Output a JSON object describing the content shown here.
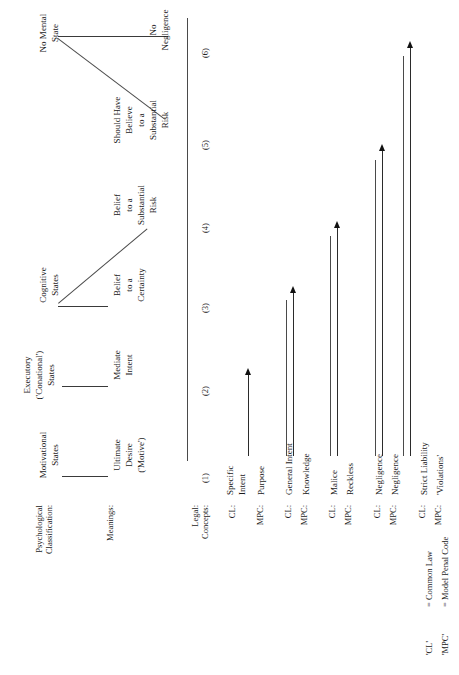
{
  "figure": {
    "type": "taxonomy-diagram",
    "orientation": "rotated-90-ccw",
    "row_labels": {
      "psychological": "Psychological\nClassification:",
      "psychological_line1": "Psychological",
      "psychological_line2": "Classification:",
      "meanings": "Meanings:",
      "legal_line1": "Legal:",
      "legal_line2": "Concepts:"
    },
    "groups": [
      {
        "id": "motivational",
        "heading_line1": "Motivational",
        "heading_line2": "States",
        "meaning_line1": "Ultimate",
        "meaning_line2": "Desire",
        "meaning_line3": "('Motive')",
        "column": "(1)"
      },
      {
        "id": "executory",
        "heading_line1": "Executory",
        "heading_line2": "('Conational')",
        "heading_line3": "States",
        "meaning_line1": "Mediate",
        "meaning_line2": "Intent",
        "column": "(2)"
      },
      {
        "id": "cognitive",
        "heading_line1": "Cognitive",
        "heading_line2": "States",
        "children": [
          {
            "meaning_line1": "Belief",
            "meaning_line2": "to a",
            "meaning_line3": "Certainty",
            "column": "(3)"
          },
          {
            "meaning_line1": "Belief",
            "meaning_line2": "to a",
            "meaning_line3": "Substantial",
            "meaning_line4": "Risk",
            "column": "(4)"
          }
        ]
      },
      {
        "id": "no-mental-state",
        "heading_line1": "No Mental",
        "heading_line2": "State",
        "children": [
          {
            "meaning_line1": "Should Have",
            "meaning_line2": "Believe",
            "meaning_line3": "to a",
            "meaning_line4": "Substantial",
            "meaning_line5": "Risk",
            "column": "(5)"
          },
          {
            "meaning_line1": "No",
            "meaning_line2": "Negligence",
            "column": "(6)"
          }
        ]
      }
    ],
    "columns": [
      "(1)",
      "(2)",
      "(3)",
      "(4)",
      "(5)",
      "(6)"
    ],
    "legal_concepts": [
      {
        "source": "CL:",
        "term_line1": "Specific",
        "term_line2": "Intent"
      },
      {
        "source": "MPC:",
        "term_line1": "Purpose",
        "term_line2": ""
      },
      {
        "source": "CL:",
        "term_line1": "General Intent",
        "term_line2": ""
      },
      {
        "source": "MPC:",
        "term_line1": "Knowledge",
        "term_line2": ""
      },
      {
        "source": "CL:",
        "term_line1": "Malice",
        "term_line2": ""
      },
      {
        "source": "MPC:",
        "term_line1": "Reckless",
        "term_line2": ""
      },
      {
        "source": "CL:",
        "term_line1": "Negligence",
        "term_line2": ""
      },
      {
        "source": "MPC:",
        "term_line1": "Negligence",
        "term_line2": ""
      },
      {
        "source": "CL:",
        "term_line1": "Strict Liability",
        "term_line2": ""
      },
      {
        "source": "MPC:",
        "term_line1": "'Violations'",
        "term_line2": ""
      }
    ],
    "legend": [
      {
        "abbr": "'CL'",
        "equals": "= Common Law"
      },
      {
        "abbr": "'MPC'",
        "equals": "= Model Penal Code"
      }
    ]
  }
}
